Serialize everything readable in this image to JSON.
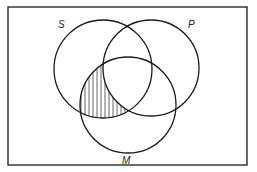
{
  "diagram": {
    "type": "venn",
    "universe_border": {
      "x": 8,
      "y": 7,
      "width": 239,
      "height": 158
    },
    "sets": [
      {
        "id": "S",
        "label": "S",
        "cx": 103,
        "cy": 69,
        "r": 49,
        "label_x": 58,
        "label_y": 28
      },
      {
        "id": "P",
        "label": "P",
        "cx": 151,
        "cy": 68,
        "r": 48,
        "label_x": 188,
        "label_y": 28
      },
      {
        "id": "M",
        "label": "M",
        "cx": 128,
        "cy": 105,
        "r": 48,
        "label_x": 122,
        "label_y": 164
      }
    ],
    "shaded_region": {
      "description": "S ∩ M − P",
      "pattern": "vertical-hatch"
    },
    "stroke_color": "#1a1a1a",
    "hatch_color": "#555555"
  }
}
